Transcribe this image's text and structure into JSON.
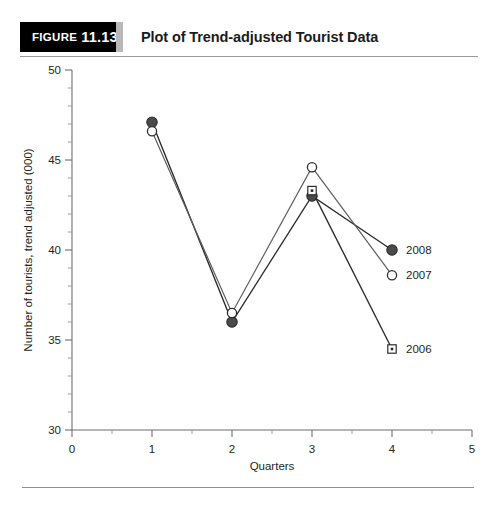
{
  "header": {
    "figure_label": "Figure",
    "figure_number": "11.13",
    "title": "Plot of Trend-adjusted Tourist Data"
  },
  "chart_data": {
    "type": "line",
    "title": "Plot of Trend-adjusted Tourist Data",
    "xlabel": "Quarters",
    "ylabel": "Number of tourists, trend adjusted (000)",
    "xlim": [
      0,
      5
    ],
    "ylim": [
      30,
      50
    ],
    "x_ticks": [
      0,
      1,
      2,
      3,
      4,
      5
    ],
    "x_tick_labels": [
      "0",
      "1",
      "2",
      "3",
      "4",
      "5"
    ],
    "x_minor_step": 0.5,
    "y_ticks": [
      30,
      35,
      40,
      45,
      50
    ],
    "y_tick_labels": [
      "30",
      "35",
      "40",
      "45",
      "50"
    ],
    "y_minor_step": 1,
    "grid": false,
    "legend_position": "right-inline-at-series-end",
    "x": [
      1,
      2,
      3,
      4
    ],
    "series": [
      {
        "name": "2008",
        "label": "2008",
        "marker": "filled-circle",
        "color": "#4a4a4a",
        "x": [
          1,
          2,
          3,
          4
        ],
        "values": [
          47.1,
          36.0,
          43.0,
          40.0
        ]
      },
      {
        "name": "2007",
        "label": "2007",
        "marker": "open-circle",
        "color": "#ffffff",
        "x": [
          1,
          2,
          3,
          4
        ],
        "values": [
          46.6,
          36.5,
          44.6,
          38.6
        ]
      },
      {
        "name": "2006",
        "label": "2006",
        "marker": "open-square",
        "color": "#ffffff",
        "x": [
          3,
          4
        ],
        "values": [
          43.3,
          34.5
        ]
      }
    ]
  }
}
